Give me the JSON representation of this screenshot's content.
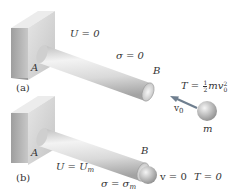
{
  "panels": [
    {
      "id": "a",
      "caption": "(a)",
      "support_label": "A",
      "end_label": "B",
      "energy_label": "U = 0",
      "stress_label": "σ = 0",
      "kinetic": {
        "lhs": "T = ",
        "frac_num": "1",
        "frac_den": "2",
        "body": "mv",
        "sup": "2",
        "sub": "0"
      },
      "velocity_label": "v",
      "velocity_sub": "0",
      "mass_label": "m"
    },
    {
      "id": "b",
      "caption": "(b)",
      "support_label": "A",
      "end_label": "B",
      "energy_lhs": "U = U",
      "energy_sub": "m",
      "stress_lhs": "σ = σ",
      "stress_sub": "m",
      "velocity_state": "v = 0",
      "kinetic_state": "T = 0"
    }
  ],
  "colors": {
    "wall_front": "#d6d6d6",
    "wall_side": "#b8b8b8",
    "wall_top": "#e4e4e4",
    "rod_light": "#f2f2f2",
    "rod_dark": "#a8a8a8",
    "ball": "#bdbdbd",
    "arrow": "#6f7f8f",
    "text": "#333333"
  }
}
